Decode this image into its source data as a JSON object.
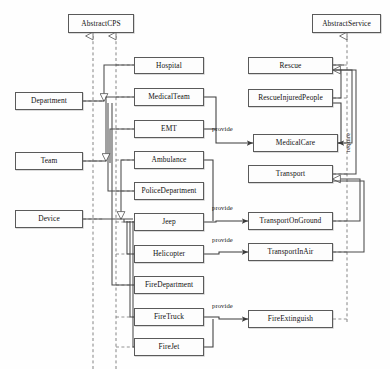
{
  "diagram": {
    "canvas": {
      "width": 390,
      "height": 369
    },
    "style": {
      "background": "#fefefe",
      "node_fill": "#fdfdfd",
      "node_border": "#5a5a5a",
      "line": "#4a4a4a",
      "dashed_line": "#6f6f6f",
      "text": "#111111"
    },
    "abstract_nodes": [
      {
        "id": "abstract-cps",
        "label": "AbstractCPS",
        "x": 68,
        "y": 14,
        "w": 66,
        "h": 19
      },
      {
        "id": "abstract-service",
        "label": "AbstractService",
        "x": 312,
        "y": 14,
        "w": 69,
        "h": 19
      }
    ],
    "category_nodes": [
      {
        "id": "department",
        "label": "Department",
        "x": 15,
        "y": 92,
        "w": 68,
        "h": 18
      },
      {
        "id": "team",
        "label": "Team",
        "x": 15,
        "y": 152,
        "w": 68,
        "h": 18
      },
      {
        "id": "device",
        "label": "Device",
        "x": 15,
        "y": 210,
        "w": 68,
        "h": 18
      }
    ],
    "cps_nodes": [
      {
        "id": "hospital",
        "label": "Hospital",
        "x": 134,
        "y": 57,
        "w": 70,
        "h": 17
      },
      {
        "id": "medical-team",
        "label": "MedicalTeam",
        "x": 134,
        "y": 88,
        "w": 70,
        "h": 18
      },
      {
        "id": "emt",
        "label": "EMT",
        "x": 134,
        "y": 120,
        "w": 70,
        "h": 18
      },
      {
        "id": "ambulance",
        "label": "Ambulance",
        "x": 134,
        "y": 151,
        "w": 70,
        "h": 18
      },
      {
        "id": "police-department",
        "label": "PoliceDepartment",
        "x": 134,
        "y": 182,
        "w": 70,
        "h": 18
      },
      {
        "id": "jeep",
        "label": "Jeep",
        "x": 134,
        "y": 213,
        "w": 70,
        "h": 18
      },
      {
        "id": "helicopter",
        "label": "Helicopter",
        "x": 134,
        "y": 245,
        "w": 70,
        "h": 18
      },
      {
        "id": "fire-department",
        "label": "FireDepartment",
        "x": 134,
        "y": 276,
        "w": 70,
        "h": 18
      },
      {
        "id": "fire-truck",
        "label": "FireTruck",
        "x": 134,
        "y": 308,
        "w": 70,
        "h": 18
      },
      {
        "id": "fire-jet",
        "label": "FireJet",
        "x": 134,
        "y": 338,
        "w": 70,
        "h": 18
      }
    ],
    "service_nodes": [
      {
        "id": "rescue",
        "label": "Rescue",
        "x": 248,
        "y": 57,
        "w": 85,
        "h": 17
      },
      {
        "id": "rescue-injured-people",
        "label": "RescueInjuredPeople",
        "x": 248,
        "y": 89,
        "w": 85,
        "h": 18
      },
      {
        "id": "medical-care",
        "label": "MedicalCare",
        "x": 253,
        "y": 134,
        "w": 85,
        "h": 18
      },
      {
        "id": "transport",
        "label": "Transport",
        "x": 248,
        "y": 165,
        "w": 85,
        "h": 18
      },
      {
        "id": "transport-on-ground",
        "label": "TransportOnGround",
        "x": 248,
        "y": 212,
        "w": 85,
        "h": 18
      },
      {
        "id": "transport-in-air",
        "label": "TransportInAir",
        "x": 248,
        "y": 243,
        "w": 85,
        "h": 18
      },
      {
        "id": "fire-extinguish",
        "label": "FireExtinguish",
        "x": 248,
        "y": 310,
        "w": 85,
        "h": 18
      }
    ],
    "edge_labels": [
      {
        "id": "provide-medical-care",
        "text": "provide",
        "x": 212,
        "y": 125
      },
      {
        "id": "provide-transport-on-ground",
        "text": "provide",
        "x": 212,
        "y": 204
      },
      {
        "id": "provide-transport-in-air",
        "text": "provide",
        "x": 212,
        "y": 236
      },
      {
        "id": "provide-fire-extinguish",
        "text": "provide",
        "x": 212,
        "y": 302
      },
      {
        "id": "require-medical-care",
        "text": "require",
        "x": 346,
        "y": 152
      }
    ],
    "relations": [
      {
        "type": "generalization",
        "from": "department",
        "to": "abstract-cps"
      },
      {
        "type": "generalization",
        "from": "team",
        "to": "abstract-cps"
      },
      {
        "type": "generalization",
        "from": "device",
        "to": "abstract-cps"
      },
      {
        "type": "generalization",
        "from": "hospital",
        "to": "department"
      },
      {
        "type": "generalization",
        "from": "police-department",
        "to": "department"
      },
      {
        "type": "generalization",
        "from": "fire-department",
        "to": "department"
      },
      {
        "type": "generalization",
        "from": "medical-team",
        "to": "team"
      },
      {
        "type": "generalization",
        "from": "emt",
        "to": "team"
      },
      {
        "type": "generalization",
        "from": "ambulance",
        "to": "device"
      },
      {
        "type": "generalization",
        "from": "jeep",
        "to": "device"
      },
      {
        "type": "generalization",
        "from": "helicopter",
        "to": "device"
      },
      {
        "type": "generalization",
        "from": "fire-truck",
        "to": "device"
      },
      {
        "type": "generalization",
        "from": "fire-jet",
        "to": "device"
      },
      {
        "type": "generalization",
        "from": "rescue-injured-people",
        "to": "rescue"
      },
      {
        "type": "generalization",
        "from": "medical-care",
        "to": "rescue"
      },
      {
        "type": "generalization",
        "from": "transport",
        "to": "rescue"
      },
      {
        "type": "generalization",
        "from": "transport-on-ground",
        "to": "transport"
      },
      {
        "type": "generalization",
        "from": "transport-in-air",
        "to": "transport"
      },
      {
        "type": "generalization",
        "from": "rescue",
        "to": "abstract-service"
      },
      {
        "type": "provide",
        "from": "emt",
        "to": "medical-care",
        "label": "provide"
      },
      {
        "type": "provide",
        "from": "jeep",
        "to": "transport-on-ground",
        "label": "provide"
      },
      {
        "type": "provide",
        "from": "helicopter",
        "to": "transport-in-air",
        "label": "provide"
      },
      {
        "type": "provide",
        "from": "fire-truck",
        "to": "fire-extinguish",
        "label": "provide"
      },
      {
        "type": "require",
        "from": "rescue-injured-people",
        "to": "medical-care",
        "label": "require"
      }
    ]
  }
}
